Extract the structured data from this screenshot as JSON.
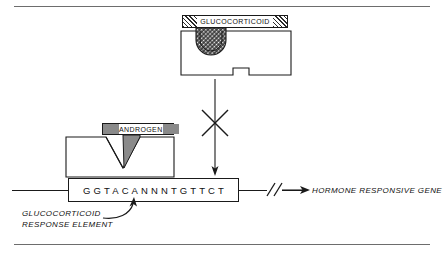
{
  "figure": {
    "glucocorticoid": {
      "ligand_label": "GLUCOCORTICOID",
      "receptor_line1": "GLUCOCORTICOID",
      "receptor_line2": "RECEPTOR"
    },
    "androgen": {
      "ligand_label": "ANDROGEN",
      "receptor_line1": "ANDROGEN",
      "receptor_line2": "RECEPTOR"
    },
    "dna": {
      "sequence": "GGTACANNNTGTTCT",
      "break_symbol": "//"
    },
    "captions": {
      "response_element_line1": "GLUCOCORTICOID",
      "response_element_line2": "RESPONSE ELEMENT",
      "target_gene": "HORMONE RESPONSIVE GENE"
    },
    "colors": {
      "stroke": "#1a1a1a",
      "rule": "#6d6d6d",
      "ligand_solid": "#8a8a8a",
      "background": "#ffffff"
    }
  }
}
